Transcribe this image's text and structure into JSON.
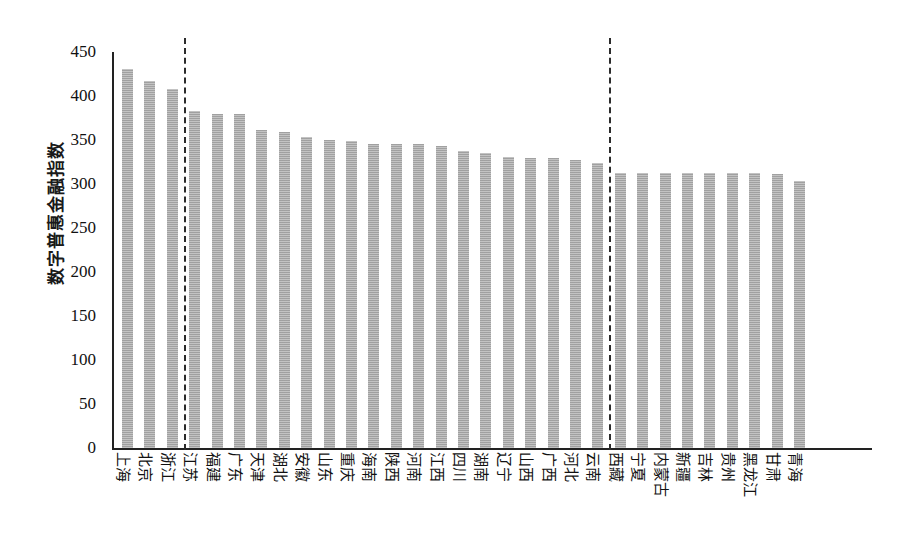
{
  "chart_data": {
    "type": "bar",
    "title": "",
    "xlabel": "",
    "ylabel": "数字普惠金融指数",
    "ylim": [
      0,
      450
    ],
    "yticks": [
      0,
      50,
      100,
      150,
      200,
      250,
      300,
      350,
      400,
      450
    ],
    "grid": false,
    "legend": null,
    "bar_color": "#a9a9a9",
    "categories": [
      "上海",
      "北京",
      "浙江",
      "江苏",
      "福建",
      "广东",
      "天津",
      "湖北",
      "安徽",
      "山东",
      "重庆",
      "海南",
      "陕西",
      "河南",
      "江西",
      "四川",
      "湖南",
      "辽宁",
      "山西",
      "广西",
      "河北",
      "云南",
      "西藏",
      "宁夏",
      "内蒙古",
      "新疆",
      "吉林",
      "贵州",
      "黑龙江",
      "甘肃",
      "青海"
    ],
    "values": [
      431,
      417,
      408,
      383,
      380,
      380,
      361,
      359,
      353,
      350,
      349,
      346,
      345,
      345,
      343,
      338,
      335,
      331,
      329,
      329,
      327,
      324,
      313,
      313,
      313,
      313,
      313,
      313,
      312,
      311,
      303
    ],
    "annotations": [
      {
        "name": "divider-1",
        "type": "vertical-dashed-line",
        "after_category": "浙江",
        "between": [
          "浙江",
          "江苏"
        ]
      },
      {
        "name": "divider-2",
        "type": "vertical-dashed-line",
        "after_category": "云南",
        "between": [
          "云南",
          "西藏"
        ]
      }
    ]
  }
}
